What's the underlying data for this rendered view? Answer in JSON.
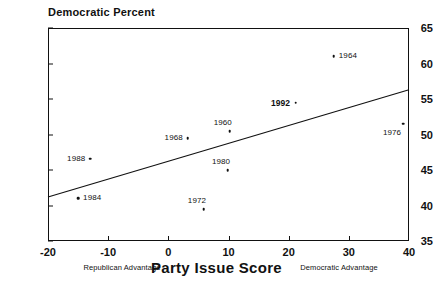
{
  "chart_data": {
    "type": "scatter",
    "title": "",
    "ylabel": "Democratic Percent",
    "xlabel": "Party Issue Score",
    "xlim": [
      -20,
      40
    ],
    "ylim": [
      35,
      65
    ],
    "xticks": [
      -20,
      -10,
      0,
      10,
      20,
      30,
      40
    ],
    "yticks": [
      35,
      40,
      45,
      50,
      55,
      60,
      65
    ],
    "grid": false,
    "legend": "none",
    "axis_annotations": {
      "left": "Republican Advantage",
      "right": "Democratic Advantage"
    },
    "points": [
      {
        "label": "1984",
        "x": -15.0,
        "y": 41.0,
        "label_pos": "right",
        "bold": false
      },
      {
        "label": "1988",
        "x": -13.0,
        "y": 46.6,
        "label_pos": "left",
        "bold": false
      },
      {
        "label": "1968",
        "x": 3.2,
        "y": 49.5,
        "label_pos": "left",
        "bold": false
      },
      {
        "label": "1972",
        "x": 5.9,
        "y": 39.5,
        "label_pos": "above-left",
        "bold": false
      },
      {
        "label": "1980",
        "x": 9.9,
        "y": 45.0,
        "label_pos": "above-left",
        "bold": false
      },
      {
        "label": "1960",
        "x": 10.2,
        "y": 50.5,
        "label_pos": "above-left",
        "bold": false
      },
      {
        "label": "1992",
        "x": 21.2,
        "y": 54.5,
        "label_pos": "left",
        "bold": true
      },
      {
        "label": "1964",
        "x": 27.5,
        "y": 61.0,
        "label_pos": "right",
        "bold": false
      },
      {
        "label": "1976",
        "x": 39.0,
        "y": 51.5,
        "label_pos": "below-left",
        "bold": false
      }
    ],
    "trend_line": {
      "x_start": -20,
      "y_start": 41.2,
      "x_end": 40,
      "y_end": 56.3
    }
  }
}
